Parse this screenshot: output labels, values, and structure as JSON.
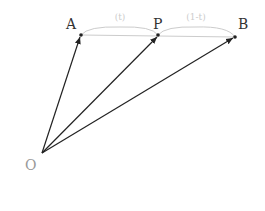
{
  "diagram": {
    "title": "",
    "points": {
      "O": {
        "label": "O",
        "x": 42,
        "y": 153
      },
      "A": {
        "label": "A",
        "x": 81,
        "y": 35
      },
      "P": {
        "label": "P",
        "x": 158,
        "y": 35
      },
      "B": {
        "label": "B",
        "x": 235,
        "y": 37
      }
    },
    "vectors": [
      {
        "from": "O",
        "to": "A"
      },
      {
        "from": "O",
        "to": "P"
      },
      {
        "from": "O",
        "to": "B"
      }
    ],
    "segments": [
      {
        "from": "A",
        "to": "B"
      }
    ],
    "braces": [
      {
        "from": "A",
        "to": "P",
        "label": "(t)"
      },
      {
        "from": "P",
        "to": "B",
        "label": "(1-t)"
      }
    ],
    "colors": {
      "vector": "#222222",
      "segment": "#cccccc",
      "brace": "#cccccc"
    }
  }
}
